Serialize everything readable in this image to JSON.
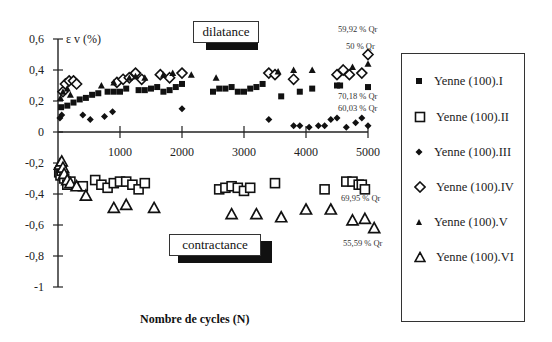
{
  "chart_data": {
    "type": "scatter",
    "title": "",
    "xlabel": "Nombre de cycles (N)",
    "ylabel": "ε v (%)",
    "xlim": [
      0,
      5000
    ],
    "ylim": [
      -1,
      0.6
    ],
    "xticks": [
      "1000",
      "2000",
      "3000",
      "4000",
      "5000"
    ],
    "yticks": [
      "0,6",
      "0,4",
      "0,2",
      "0",
      "-0,2",
      "-0,4",
      "-0,6",
      "-0,8",
      "-1"
    ],
    "grid": false,
    "legend_position": "right",
    "annotations": {
      "dilatance": "dilatance",
      "contractance": "contractance",
      "qr1": "59,92 % Qr",
      "qr2": "50 % Qr",
      "qr3": "70,18 % Qr",
      "qr4": "60,03 % Qr",
      "qr5": "69,95 % Qr",
      "qr6": "55,59 % Qr"
    },
    "series": [
      {
        "name": "Yenne (100).I",
        "marker": "filled-square",
        "points": [
          [
            50,
            0.16
          ],
          [
            150,
            0.17
          ],
          [
            250,
            0.19
          ],
          [
            350,
            0.21
          ],
          [
            450,
            0.22
          ],
          [
            550,
            0.24
          ],
          [
            650,
            0.25
          ],
          [
            800,
            0.26
          ],
          [
            900,
            0.26
          ],
          [
            1000,
            0.26
          ],
          [
            1100,
            0.28
          ],
          [
            1200,
            0.36
          ],
          [
            1300,
            0.27
          ],
          [
            1400,
            0.27
          ],
          [
            1500,
            0.28
          ],
          [
            1600,
            0.29
          ],
          [
            1700,
            0.26
          ],
          [
            1800,
            0.27
          ],
          [
            1900,
            0.29
          ],
          [
            2000,
            0.31
          ],
          [
            2500,
            0.26
          ],
          [
            2600,
            0.28
          ],
          [
            2700,
            0.28
          ],
          [
            2800,
            0.29
          ],
          [
            2900,
            0.26
          ],
          [
            3000,
            0.26
          ],
          [
            3100,
            0.28
          ],
          [
            3200,
            0.29
          ],
          [
            3300,
            0.31
          ],
          [
            3600,
            0.23
          ],
          [
            3900,
            0.26
          ],
          [
            4100,
            0.28
          ],
          [
            4500,
            0.3
          ],
          [
            4550,
            0.3
          ],
          [
            5000,
            0.29
          ]
        ]
      },
      {
        "name": "Yenne (100).II",
        "marker": "open-square",
        "points": [
          [
            20,
            -0.26
          ],
          [
            40,
            -0.28
          ],
          [
            60,
            -0.25
          ],
          [
            100,
            -0.3
          ],
          [
            150,
            -0.34
          ],
          [
            200,
            -0.32
          ],
          [
            400,
            -0.35
          ],
          [
            600,
            -0.31
          ],
          [
            700,
            -0.34
          ],
          [
            800,
            -0.36
          ],
          [
            900,
            -0.33
          ],
          [
            1000,
            -0.32
          ],
          [
            1100,
            -0.32
          ],
          [
            1200,
            -0.34
          ],
          [
            1300,
            -0.37
          ],
          [
            1400,
            -0.33
          ],
          [
            2600,
            -0.37
          ],
          [
            2700,
            -0.36
          ],
          [
            2800,
            -0.35
          ],
          [
            2900,
            -0.36
          ],
          [
            3000,
            -0.38
          ],
          [
            3100,
            -0.36
          ],
          [
            3500,
            -0.33
          ],
          [
            4300,
            -0.37
          ],
          [
            4650,
            -0.32
          ],
          [
            4750,
            -0.32
          ],
          [
            4850,
            -0.34
          ],
          [
            4900,
            -0.34
          ],
          [
            4950,
            -0.37
          ]
        ]
      },
      {
        "name": "Yenne (100).III",
        "marker": "filled-diamond",
        "points": [
          [
            30,
            0.09
          ],
          [
            60,
            0.11
          ],
          [
            400,
            0.11
          ],
          [
            520,
            0.08
          ],
          [
            750,
            0.1
          ],
          [
            880,
            0.13
          ],
          [
            2000,
            0.15
          ],
          [
            3400,
            0.08
          ],
          [
            3800,
            0.04
          ],
          [
            3900,
            0.04
          ],
          [
            4050,
            0.03
          ],
          [
            4200,
            0.04
          ],
          [
            4300,
            0.04
          ],
          [
            4400,
            0.08
          ],
          [
            4500,
            0.09
          ],
          [
            4650,
            0.03
          ],
          [
            4800,
            0.06
          ],
          [
            4900,
            0.09
          ],
          [
            5000,
            0.04
          ]
        ]
      },
      {
        "name": "Yenne (100).IV",
        "marker": "open-diamond",
        "points": [
          [
            80,
            0.26
          ],
          [
            120,
            0.31
          ],
          [
            180,
            0.33
          ],
          [
            250,
            0.33
          ],
          [
            300,
            0.31
          ],
          [
            950,
            0.32
          ],
          [
            1050,
            0.34
          ],
          [
            1150,
            0.35
          ],
          [
            1250,
            0.38
          ],
          [
            1350,
            0.34
          ],
          [
            1650,
            0.37
          ],
          [
            1800,
            0.35
          ],
          [
            2000,
            0.38
          ],
          [
            3400,
            0.38
          ],
          [
            3500,
            0.37
          ],
          [
            3800,
            0.34
          ],
          [
            4500,
            0.37
          ],
          [
            4600,
            0.4
          ],
          [
            4700,
            0.37
          ],
          [
            4900,
            0.38
          ],
          [
            5000,
            0.5
          ]
        ]
      },
      {
        "name": "Yenne (100).V",
        "marker": "filled-triangle",
        "points": [
          [
            40,
            0.22
          ],
          [
            80,
            0.26
          ],
          [
            150,
            0.28
          ],
          [
            200,
            0.24
          ],
          [
            700,
            0.3
          ],
          [
            900,
            0.32
          ],
          [
            1150,
            0.35
          ],
          [
            1250,
            0.36
          ],
          [
            1400,
            0.35
          ],
          [
            1700,
            0.37
          ],
          [
            1850,
            0.38
          ],
          [
            2150,
            0.37
          ],
          [
            2550,
            0.35
          ],
          [
            3550,
            0.39
          ],
          [
            3800,
            0.4
          ],
          [
            4100,
            0.4
          ],
          [
            4750,
            0.42
          ],
          [
            5000,
            0.44
          ]
        ]
      },
      {
        "name": "Yenne (100).VI",
        "marker": "open-triangle",
        "points": [
          [
            30,
            -0.21
          ],
          [
            60,
            -0.19
          ],
          [
            80,
            -0.23
          ],
          [
            100,
            -0.27
          ],
          [
            150,
            -0.31
          ],
          [
            200,
            -0.33
          ],
          [
            300,
            -0.35
          ],
          [
            450,
            -0.41
          ],
          [
            900,
            -0.49
          ],
          [
            1100,
            -0.47
          ],
          [
            1550,
            -0.49
          ],
          [
            2800,
            -0.53
          ],
          [
            3200,
            -0.53
          ],
          [
            3600,
            -0.55
          ],
          [
            4000,
            -0.5
          ],
          [
            4400,
            -0.5
          ],
          [
            4750,
            -0.57
          ],
          [
            4950,
            -0.56
          ],
          [
            5100,
            -0.62
          ]
        ]
      }
    ]
  },
  "axis": {
    "ylabel_eps": "ε",
    "ylabel_rest": "v (%)",
    "xlabel": "Nombre de cycles (N)"
  },
  "legend": {
    "items": [
      {
        "label": "Yenne (100).I"
      },
      {
        "label": "Yenne (100).II"
      },
      {
        "label": "Yenne (100).III"
      },
      {
        "label": "Yenne (100).IV"
      },
      {
        "label": "Yenne (100).V"
      },
      {
        "label": "Yenne (100).VI"
      }
    ]
  }
}
